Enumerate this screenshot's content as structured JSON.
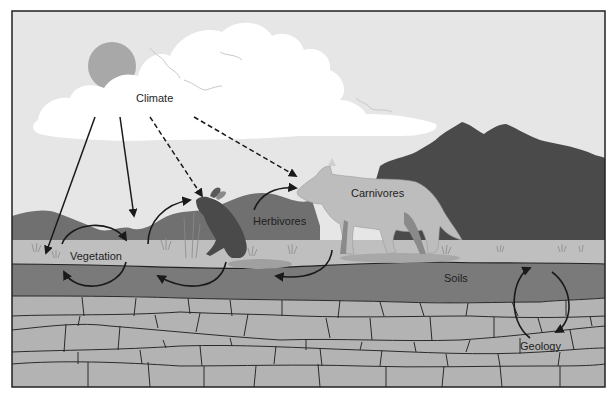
{
  "diagram": {
    "labels": {
      "climate": "Climate",
      "vegetation": "Vegetation",
      "herbivores": "Herbivores",
      "carnivores": "Carnivores",
      "soils": "Soils",
      "geology": "Geology"
    },
    "arrows": [
      {
        "from": "Climate",
        "to": "Vegetation",
        "style": "solid"
      },
      {
        "from": "Climate",
        "to": "Vegetation",
        "style": "solid"
      },
      {
        "from": "Climate",
        "to": "Herbivores",
        "style": "dashed"
      },
      {
        "from": "Climate",
        "to": "Carnivores",
        "style": "dashed"
      }
    ],
    "cycles": [
      {
        "between": [
          "Vegetation",
          "Soils"
        ],
        "type": "circular"
      },
      {
        "between": [
          "Vegetation",
          "Herbivores"
        ],
        "type": "circular"
      },
      {
        "between": [
          "Herbivores",
          "Carnivores"
        ],
        "type": "circular"
      },
      {
        "between": [
          "Soils",
          "Geology"
        ],
        "type": "circular"
      }
    ],
    "colors": {
      "sky": "#e6e6e6",
      "cloud": "#ffffff",
      "sun": "#a8a8a8",
      "far_hills": "#707070",
      "mountain": "#4a4a4a",
      "ground": "#bfbfbf",
      "soil": "#7a7a7a",
      "rock": "#b3b3b3",
      "rock_lines": "#2a2a2a",
      "frame": "#222222",
      "arrow": "#1a1a1a"
    }
  }
}
